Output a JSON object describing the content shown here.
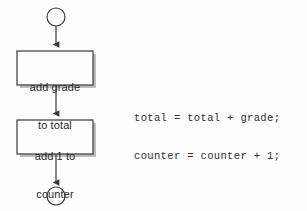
{
  "diagram": {
    "background_color": "#fdfdfd",
    "stroke_color": "#3a3a3a",
    "shadow_color": "#b9b9b9",
    "text_color": "#2b2b2b",
    "nodes": [
      {
        "id": "start-terminator",
        "type": "connector-circle",
        "label": ""
      },
      {
        "id": "process-add-grade",
        "type": "process-box",
        "label_line1": "add grade",
        "label_line2": "to total"
      },
      {
        "id": "process-add-counter",
        "type": "process-box",
        "label_line1": "add 1 to",
        "label_line2": "counter"
      },
      {
        "id": "end-terminator",
        "type": "connector-circle",
        "label": ""
      }
    ],
    "connectors": [
      {
        "id": "arrow-start-to-box1",
        "from": "start-terminator",
        "to": "process-add-grade"
      },
      {
        "id": "arrow-box1-to-box2",
        "from": "process-add-grade",
        "to": "process-add-counter"
      },
      {
        "id": "arrow-box2-to-end",
        "from": "process-add-counter",
        "to": "end-terminator"
      }
    ]
  },
  "code": {
    "line1": "total = total + grade;",
    "line2": "counter = counter + 1;"
  }
}
